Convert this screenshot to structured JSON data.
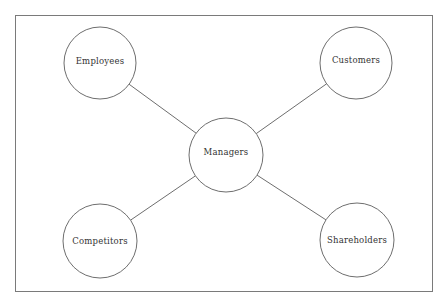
{
  "diagram": {
    "type": "hub-and-spoke stakeholder diagram",
    "colors": {
      "frame": "#7a7a7a",
      "stroke": "#6e6e6e",
      "text": "#333333",
      "background": "#ffffff"
    },
    "hub": {
      "id": "managers",
      "label": "Managers",
      "cx": 226,
      "cy": 155,
      "r": 37,
      "label_y": 152
    },
    "nodes": [
      {
        "id": "employees",
        "label": "Employees",
        "cx": 100,
        "cy": 63,
        "r": 36,
        "label_y": 61
      },
      {
        "id": "customers",
        "label": "Customers",
        "cx": 356,
        "cy": 63,
        "r": 36,
        "label_y": 60
      },
      {
        "id": "competitors",
        "label": "Competitors",
        "cx": 100,
        "cy": 241,
        "r": 37,
        "label_y": 241
      },
      {
        "id": "shareholders",
        "label": "Shareholders",
        "cx": 357,
        "cy": 240,
        "r": 37,
        "label_y": 240
      }
    ],
    "edges": [
      {
        "from": "managers",
        "to": "employees"
      },
      {
        "from": "managers",
        "to": "customers"
      },
      {
        "from": "managers",
        "to": "competitors"
      },
      {
        "from": "managers",
        "to": "shareholders"
      }
    ]
  }
}
